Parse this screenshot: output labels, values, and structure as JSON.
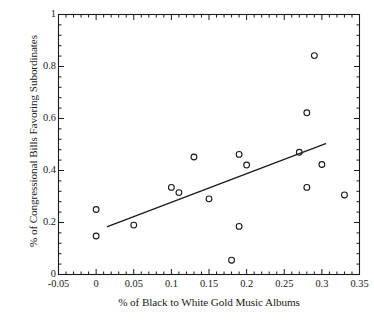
{
  "chart_data": {
    "type": "scatter",
    "title": "",
    "xlabel": "% of Black to White Gold Music Albums",
    "ylabel": "% of Congressional Bills Favoring Subordinates",
    "xlim": [
      -0.05,
      0.35
    ],
    "ylim": [
      0,
      1
    ],
    "xticks": [
      -0.05,
      0,
      0.05,
      0.1,
      0.15,
      0.2,
      0.25,
      0.3,
      0.35
    ],
    "xtick_labels": [
      "-0.05",
      "0",
      "0.05",
      "0.1",
      "0.15",
      "0.2",
      "0.25",
      "0.3",
      "0.35"
    ],
    "yticks": [
      0,
      0.2,
      0.4,
      0.6,
      0.8,
      1
    ],
    "ytick_labels": [
      "0",
      "0.2",
      "0.4",
      "0.6",
      "0.8",
      "1"
    ],
    "minor_ticks_per_interval": 5,
    "grid": false,
    "legend": null,
    "marker": "open-circle",
    "marker_color": "#1a1a1a",
    "marker_size": 5,
    "points": [
      {
        "x": 0.0,
        "y": 0.25
      },
      {
        "x": 0.0,
        "y": 0.148
      },
      {
        "x": 0.05,
        "y": 0.19
      },
      {
        "x": 0.1,
        "y": 0.335
      },
      {
        "x": 0.11,
        "y": 0.315
      },
      {
        "x": 0.13,
        "y": 0.452
      },
      {
        "x": 0.15,
        "y": 0.291
      },
      {
        "x": 0.18,
        "y": 0.055
      },
      {
        "x": 0.19,
        "y": 0.462
      },
      {
        "x": 0.19,
        "y": 0.185
      },
      {
        "x": 0.2,
        "y": 0.421
      },
      {
        "x": 0.27,
        "y": 0.47
      },
      {
        "x": 0.28,
        "y": 0.622
      },
      {
        "x": 0.28,
        "y": 0.335
      },
      {
        "x": 0.29,
        "y": 0.842
      },
      {
        "x": 0.3,
        "y": 0.423
      },
      {
        "x": 0.33,
        "y": 0.306
      }
    ],
    "trendline": {
      "type": "linear-fit",
      "color": "#1a1a1a",
      "x_start": 0.015,
      "y_start": 0.184,
      "x_end": 0.305,
      "y_end": 0.503
    },
    "axes": {
      "frame": true,
      "frame_color": "#1a1a1a",
      "tick_direction": "in",
      "background": "#ffffff"
    }
  }
}
